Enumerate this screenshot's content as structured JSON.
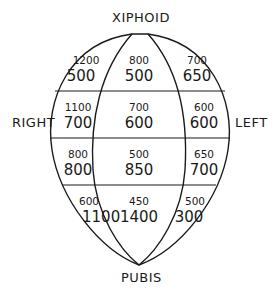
{
  "labels": {
    "top": "XIPHOID",
    "bottom": "PUBIS",
    "left": "RIGHT",
    "right": "LEFT"
  },
  "regions": [
    {
      "row": 1,
      "col": "right",
      "upper": "1200",
      "lower": "500"
    },
    {
      "row": 1,
      "col": "center",
      "upper": "800",
      "lower": "500"
    },
    {
      "row": 1,
      "col": "left",
      "upper": "700",
      "lower": "650"
    },
    {
      "row": 2,
      "col": "right",
      "upper": "1100",
      "lower": "700"
    },
    {
      "row": 2,
      "col": "center",
      "upper": "700",
      "lower": "600"
    },
    {
      "row": 2,
      "col": "left",
      "upper": "600",
      "lower": "600"
    },
    {
      "row": 3,
      "col": "right",
      "upper": "800",
      "lower": "800"
    },
    {
      "row": 3,
      "col": "center",
      "upper": "500",
      "lower": "850"
    },
    {
      "row": 3,
      "col": "left",
      "upper": "650",
      "lower": "700"
    },
    {
      "row": 4,
      "col": "right",
      "upper": "600",
      "lower": "1100"
    },
    {
      "row": 4,
      "col": "center",
      "upper": "450",
      "lower": "1400"
    },
    {
      "row": 4,
      "col": "left",
      "upper": "500",
      "lower": "300"
    }
  ],
  "colors": {
    "line": "#1a1a1a",
    "background": "#ffffff"
  }
}
